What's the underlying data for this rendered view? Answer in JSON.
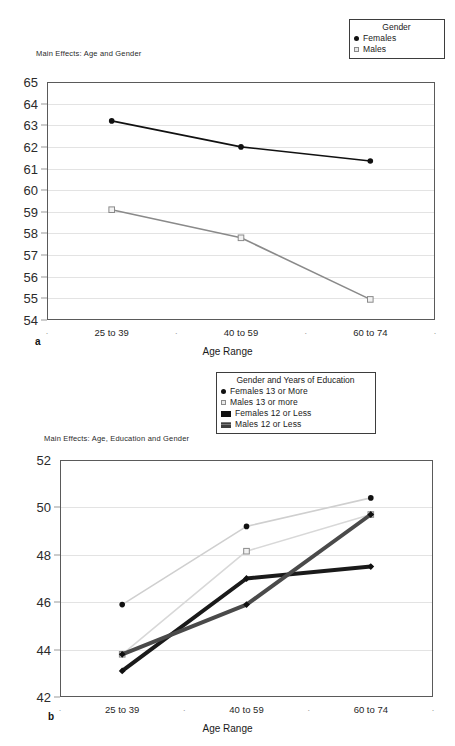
{
  "figure": {
    "panels": [
      {
        "letter": "a",
        "title": "Main Effects: Age and Gender",
        "legend_title": "Gender",
        "legend_items": [
          {
            "label": "Females",
            "marker": "filled-circle-icon"
          },
          {
            "label": "Males",
            "marker": "open-square-icon"
          }
        ],
        "xlabel": "Age Range",
        "xticks": [
          "25 to 39",
          "40 to 59",
          "60 to 74"
        ],
        "yticks": [
          "54",
          "55",
          "56",
          "57",
          "58",
          "59",
          "60",
          "61",
          "62",
          "63",
          "64",
          "65"
        ]
      },
      {
        "letter": "b",
        "title": "Main Effects: Age, Education and Gender",
        "legend_title": "Gender and Years of Education",
        "legend_items": [
          {
            "label": "Females 13 or More",
            "marker": "filled-circle-icon"
          },
          {
            "label": "Males 13 or more",
            "marker": "open-square-icon"
          },
          {
            "label": "Females 12 or Less",
            "marker": "dark-bar-icon"
          },
          {
            "label": "Males 12 or Less",
            "marker": "gray-bar-icon"
          }
        ],
        "xlabel": "Age Range",
        "xticks": [
          "25 to 39",
          "40 to 59",
          "60 to 74"
        ],
        "yticks": [
          "42",
          "44",
          "46",
          "48",
          "50",
          "52"
        ]
      }
    ]
  },
  "chart_data": [
    {
      "type": "line",
      "title": "Main Effects: Age and Gender",
      "panel": "a",
      "xlabel": "Age Range",
      "ylabel": "",
      "categories": [
        "25 to 39",
        "40 to 59",
        "60 to 74"
      ],
      "ylim": [
        54,
        65
      ],
      "ytick_step": 1,
      "grid": true,
      "legend_title": "Gender",
      "legend_position": "top-right-outside",
      "series": [
        {
          "name": "Females",
          "values": [
            63.2,
            62.0,
            61.35
          ],
          "marker": "filled-circle",
          "color": "#111111"
        },
        {
          "name": "Males",
          "values": [
            59.1,
            57.8,
            54.95
          ],
          "marker": "open-square",
          "color": "#8a8a8a"
        }
      ]
    },
    {
      "type": "line",
      "title": "Main Effects: Age, Education and Gender",
      "panel": "b",
      "xlabel": "Age Range",
      "ylabel": "",
      "categories": [
        "25 to 39",
        "40 to 59",
        "60 to 74"
      ],
      "ylim": [
        42,
        52
      ],
      "ytick_step": 2,
      "grid": true,
      "legend_title": "Gender and Years of Education",
      "legend_position": "top-center-outside",
      "series": [
        {
          "name": "Females 13 or More",
          "values": [
            45.9,
            49.2,
            50.4
          ],
          "marker": "filled-circle",
          "color": "#cfcfcf"
        },
        {
          "name": "Males 13 or more",
          "values": [
            43.8,
            48.15,
            49.7
          ],
          "marker": "open-square",
          "color": "#d8d8d8"
        },
        {
          "name": "Females 12 or Less",
          "values": [
            43.1,
            47.0,
            47.5
          ],
          "marker": "filled-diamond",
          "color": "#1a1a1a"
        },
        {
          "name": "Males 12 or Less",
          "values": [
            43.8,
            45.9,
            49.7
          ],
          "marker": "filled-diamond",
          "color": "#4a4a4a"
        }
      ]
    }
  ]
}
